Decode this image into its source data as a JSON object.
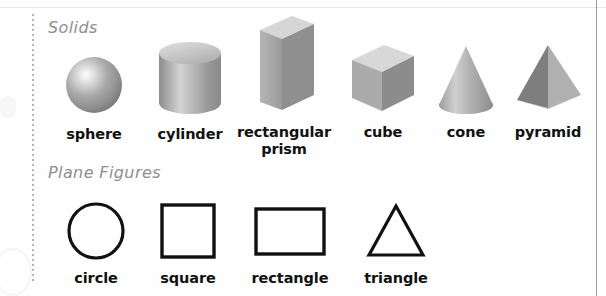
{
  "page": {
    "background_color": "#fefefe",
    "left_rule_style": "dotted",
    "left_rule_color": "#b4b4b4",
    "right_rule_color": "#9a9a9a",
    "top_rule_color": "#e6e6e6"
  },
  "sections": [
    {
      "id": "solids",
      "heading": "Solids",
      "heading_color": "#8e8e8e",
      "figures": [
        {
          "id": "sphere",
          "label": "sphere",
          "icon": "sphere-3d-icon"
        },
        {
          "id": "cylinder",
          "label": "cylinder",
          "icon": "cylinder-3d-icon"
        },
        {
          "id": "prism",
          "label": "rectangular\nprism",
          "icon": "rectangular-prism-3d-icon"
        },
        {
          "id": "cube",
          "label": "cube",
          "icon": "cube-3d-icon"
        },
        {
          "id": "cone",
          "label": "cone",
          "icon": "cone-3d-icon"
        },
        {
          "id": "pyramid",
          "label": "pyramid",
          "icon": "pyramid-3d-icon"
        }
      ]
    },
    {
      "id": "plane-figures",
      "heading": "Plane Figures",
      "heading_color": "#8e8e8e",
      "figures": [
        {
          "id": "circle",
          "label": "circle",
          "icon": "circle-outline-icon"
        },
        {
          "id": "square",
          "label": "square",
          "icon": "square-outline-icon"
        },
        {
          "id": "rectangle",
          "label": "rectangle",
          "icon": "rectangle-outline-icon"
        },
        {
          "id": "triangle",
          "label": "triangle",
          "icon": "triangle-outline-icon"
        }
      ]
    }
  ],
  "colors": {
    "shape_light": "#d2d2d2",
    "shape_mid": "#a8a8a8",
    "shape_dark": "#8a8a8a",
    "shape_darker": "#757575",
    "outline_black": "#111111",
    "caption_black": "#111111"
  }
}
